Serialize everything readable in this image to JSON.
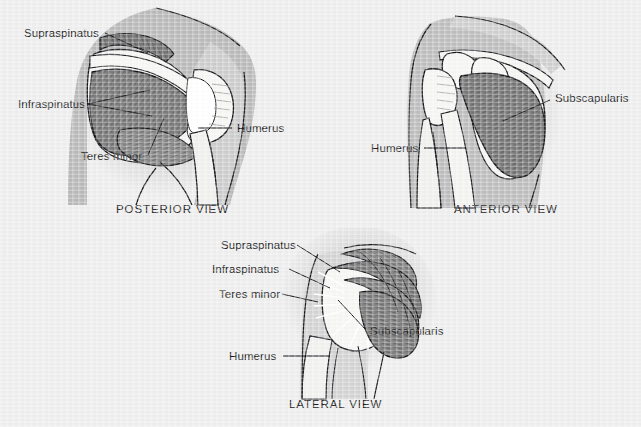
{
  "document": {
    "title": "Rotator Cuff Muscles — Three Anatomical Views",
    "background_color": "#eeeeee",
    "ink_color": "#15151a",
    "muscle_fill_color": "#7d7d7d",
    "bone_fill_color": "#f2f2f0",
    "halo_color": "#d9d9d9"
  },
  "figures": [
    {
      "id": "posterior",
      "caption": "POSTERIOR VIEW",
      "labels": [
        {
          "name": "supraspinatus",
          "text": "Supraspinatus"
        },
        {
          "name": "infraspinatus",
          "text": "Infraspinatus"
        },
        {
          "name": "teres-minor",
          "text": "Teres minor"
        },
        {
          "name": "humerus",
          "text": "Humerus"
        }
      ]
    },
    {
      "id": "anterior",
      "caption": "ANTERIOR VIEW",
      "labels": [
        {
          "name": "subscapularis",
          "text": "Subscapularis"
        },
        {
          "name": "humerus",
          "text": "Humerus"
        }
      ]
    },
    {
      "id": "lateral",
      "caption": "LATERAL VIEW",
      "labels": [
        {
          "name": "supraspinatus",
          "text": "Supraspinatus"
        },
        {
          "name": "infraspinatus",
          "text": "Infraspinatus"
        },
        {
          "name": "teres-minor",
          "text": "Teres minor"
        },
        {
          "name": "subscapularis",
          "text": "Subscapularis"
        },
        {
          "name": "humerus",
          "text": "Humerus"
        }
      ]
    }
  ]
}
